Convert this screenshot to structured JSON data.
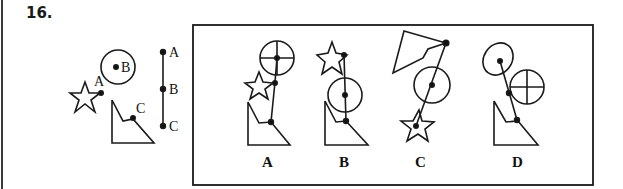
{
  "question": {
    "number": "16.",
    "reference_figure": {
      "shapes": [
        "star",
        "circle",
        "right-triangle-with-notch",
        "vertical-segment"
      ],
      "point_labels": {
        "star": "A",
        "circle": "B",
        "triangle": "C"
      },
      "segment_labels": [
        "A",
        "B",
        "C"
      ]
    },
    "options": [
      {
        "label": "A"
      },
      {
        "label": "B"
      },
      {
        "label": "C"
      },
      {
        "label": "D"
      }
    ]
  }
}
